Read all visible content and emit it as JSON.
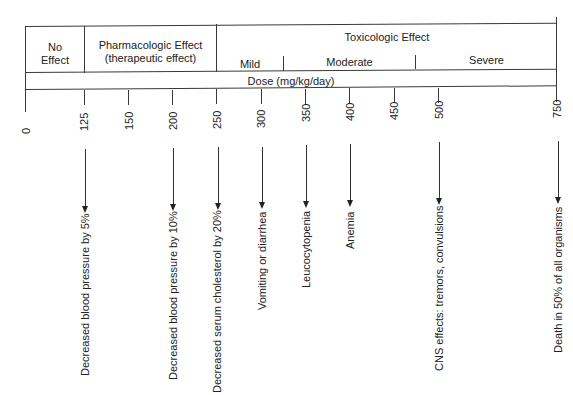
{
  "header": {
    "no_effect": "No\nEffect",
    "pharmacologic": "Pharmacologic Effect",
    "pharmacologic_sub": "(therapeutic effect)",
    "toxicologic": "Toxicologic Effect",
    "mild": "Mild",
    "moderate": "Moderate",
    "severe": "Severe",
    "dose_label": "Dose (mg/kg/day)"
  },
  "axis": {
    "ticks": [
      {
        "label": "0",
        "x": 26
      },
      {
        "label": "125",
        "x": 84
      },
      {
        "label": "150",
        "x": 129
      },
      {
        "label": "200",
        "x": 173
      },
      {
        "label": "250",
        "x": 217
      },
      {
        "label": "300",
        "x": 262
      },
      {
        "label": "350",
        "x": 306
      },
      {
        "label": "400",
        "x": 350
      },
      {
        "label": "450",
        "x": 395
      },
      {
        "label": "500",
        "x": 438
      },
      {
        "label": "750",
        "x": 557
      }
    ]
  },
  "effects": [
    {
      "dose": "125",
      "label": "Decreased blood pressure by 5%"
    },
    {
      "dose": "200",
      "label": "Decreased blood pressure by 10%"
    },
    {
      "dose": "250",
      "label": "Decreased serum cholesterol by 20%"
    },
    {
      "dose": "300",
      "label": "Vomiting or diarrhea"
    },
    {
      "dose": "350",
      "label": "Leucocytopenia"
    },
    {
      "dose": "400",
      "label": "Anemia"
    },
    {
      "dose": "500",
      "label": "CNS effects: tremors, convulsions"
    },
    {
      "dose": "750",
      "label": "Death in 50% of all organisms"
    }
  ]
}
